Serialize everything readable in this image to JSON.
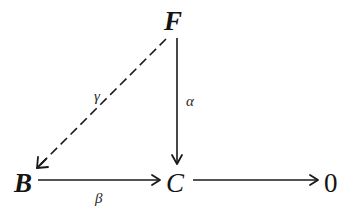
{
  "diagram": {
    "type": "commutative-diagram",
    "nodes": {
      "F": {
        "label": "F",
        "style": "bold-italic"
      },
      "B": {
        "label": "B",
        "style": "bold-italic"
      },
      "C": {
        "label": "C",
        "style": "italic"
      },
      "zero": {
        "label": "0",
        "style": "roman"
      }
    },
    "edges": [
      {
        "id": "gamma",
        "from": "F",
        "to": "B",
        "label": "γ",
        "line": "dashed"
      },
      {
        "id": "alpha",
        "from": "F",
        "to": "C",
        "label": "α",
        "line": "solid"
      },
      {
        "id": "beta",
        "from": "B",
        "to": "C",
        "label": "β",
        "line": "solid"
      },
      {
        "id": "c-to-zero",
        "from": "C",
        "to": "zero",
        "label": "",
        "line": "solid"
      }
    ]
  }
}
